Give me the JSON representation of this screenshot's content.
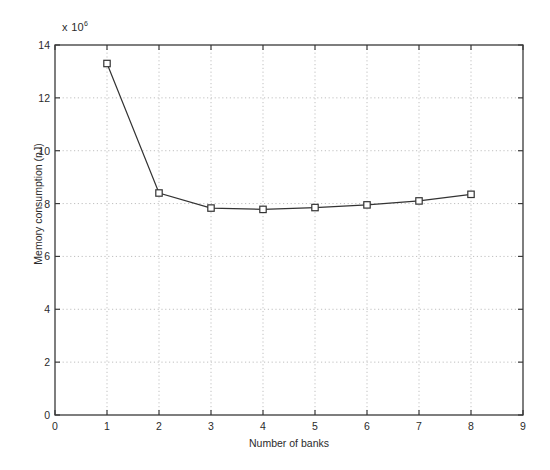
{
  "chart_data": {
    "type": "line",
    "title": "",
    "subtitle": "",
    "xlabel": "Number of banks",
    "ylabel": "Memory consumption (nJ)",
    "y_exponent_label": "x 10",
    "y_exponent_value": "6",
    "y_scale_note": "x 10^6",
    "xlim": [
      0,
      9
    ],
    "ylim": [
      0,
      14
    ],
    "xticks": [
      0,
      1,
      2,
      3,
      4,
      5,
      6,
      7,
      8,
      9
    ],
    "yticks": [
      0,
      2,
      4,
      6,
      8,
      10,
      12,
      14
    ],
    "xticklabels": [
      "0",
      "1",
      "2",
      "3",
      "4",
      "5",
      "6",
      "7",
      "8",
      "9"
    ],
    "yticklabels": [
      "0",
      "2",
      "4",
      "6",
      "8",
      "10",
      "12",
      "14"
    ],
    "grid": true,
    "grid_style": "dotted",
    "legend": null,
    "legend_position": "none",
    "marker": "square",
    "line_color": "#333333",
    "marker_color": "#333333",
    "x": [
      1,
      2,
      3,
      4,
      5,
      6,
      7,
      8
    ],
    "values": [
      13.3,
      8.4,
      7.83,
      7.78,
      7.85,
      7.95,
      8.1,
      8.35
    ],
    "series": [
      {
        "name": "Memory consumption",
        "x": [
          1,
          2,
          3,
          4,
          5,
          6,
          7,
          8
        ],
        "values": [
          13.3,
          8.4,
          7.83,
          7.78,
          7.85,
          7.95,
          8.1,
          8.35
        ]
      }
    ]
  },
  "colors": {
    "background": "#ffffff",
    "axis": "#3a3a3a",
    "grid": "#b9b9b9",
    "line": "#333333"
  }
}
